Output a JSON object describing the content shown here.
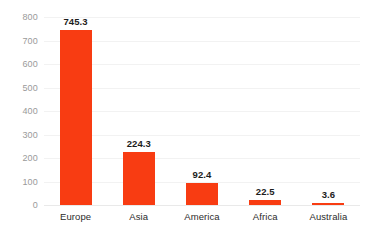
{
  "chart_data": {
    "type": "bar",
    "title": "",
    "subtitle": "",
    "xlabel": "",
    "ylabel": "",
    "categories": [
      "Europe",
      "Asia",
      "America",
      "Africa",
      "Australia"
    ],
    "values": [
      745.3,
      224.3,
      92.4,
      22.5,
      3.6
    ],
    "value_labels": [
      "745.3",
      "224.3",
      "92.4",
      "22.5",
      "3.6"
    ],
    "ylim": [
      0,
      800
    ],
    "yticks": [
      0,
      100,
      200,
      300,
      400,
      500,
      600,
      700,
      800
    ],
    "ytick_labels": [
      "0",
      "100",
      "200",
      "300",
      "400",
      "500",
      "600",
      "700",
      "800"
    ],
    "grid": true,
    "grid_axis": "y",
    "legend": false,
    "legend_position": "none",
    "bar_color": "#f83c12",
    "gridline_color": "#f2f2f2",
    "axis_label_color": "#2b2b2b",
    "tick_label_color": "#9a9a9a",
    "value_label_color": "#1c1c1c",
    "background_color": "#ffffff"
  }
}
